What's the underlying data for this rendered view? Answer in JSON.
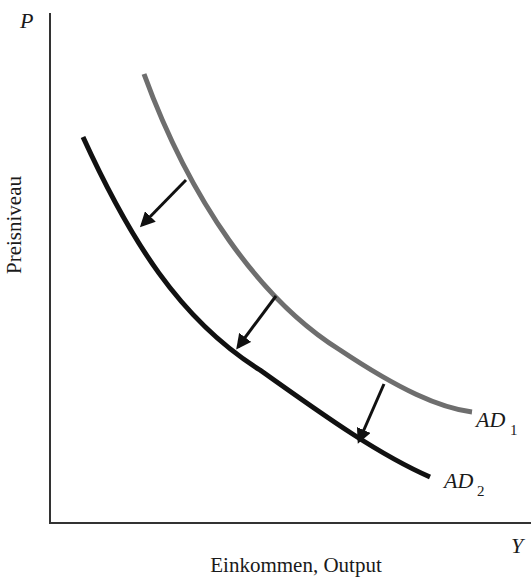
{
  "diagram": {
    "title": "",
    "axes": {
      "y_axis_symbol": "P",
      "x_axis_symbol": "Y",
      "y_axis_label": "Preisniveau",
      "x_axis_label": "Einkommen, Output"
    },
    "curves": [
      {
        "id": "AD1",
        "label_main": "AD",
        "label_sub": "1",
        "color": "#6e6e6e",
        "description": "initial aggregate demand curve"
      },
      {
        "id": "AD2",
        "label_main": "AD",
        "label_sub": "2",
        "color": "#111111",
        "description": "shifted aggregate demand curve"
      }
    ],
    "arrows": {
      "count": 3,
      "direction": "down-left",
      "meaning": "shift from AD1 to AD2",
      "color": "#111111"
    }
  }
}
